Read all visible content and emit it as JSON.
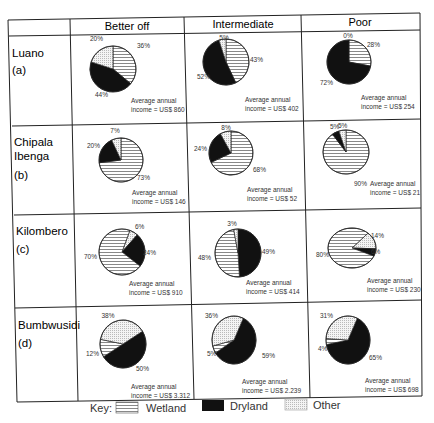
{
  "columns": [
    "Better off",
    "Intermediate",
    "Poor"
  ],
  "rows": [
    {
      "site": "Luano",
      "label": "(a)"
    },
    {
      "site": "Chipala Ibenga",
      "site_lines": [
        "Chipala",
        "Ibenga"
      ],
      "label": "(b)"
    },
    {
      "site": "Kilombero",
      "label": "(c)"
    },
    {
      "site": "Bumbwusidi",
      "label": "(d)"
    }
  ],
  "key": {
    "title": "Key:",
    "items": [
      {
        "name": "Wetland",
        "pattern": "hatch"
      },
      {
        "name": "Dryland",
        "pattern": "solid",
        "color": "#111111"
      },
      {
        "name": "Other",
        "pattern": "dots"
      }
    ]
  },
  "income_prefix": "Average annual",
  "chart_data": {
    "type": "pie",
    "legend": [
      "Wetland",
      "Dryland",
      "Other"
    ],
    "legend_position": "bottom",
    "pies": [
      {
        "site": "Luano (a)",
        "group": "Better off",
        "wetland": 36,
        "dryland": 44,
        "other": 20,
        "income": "income = US$ 860"
      },
      {
        "site": "Luano (a)",
        "group": "Intermediate",
        "wetland": 43,
        "dryland": 52,
        "other": 5,
        "income": "income = US$ 402"
      },
      {
        "site": "Luano (a)",
        "group": "Poor",
        "wetland": 28,
        "dryland": 72,
        "other": 0,
        "income": "income = US$ 254"
      },
      {
        "site": "Chipala Ibenga (b)",
        "group": "Better off",
        "wetland": 73,
        "dryland": 20,
        "other": 7,
        "income": "income = US$ 146"
      },
      {
        "site": "Chipala Ibenga (b)",
        "group": "Intermediate",
        "wetland": 68,
        "dryland": 24,
        "other": 8,
        "income": "income = US$ 52"
      },
      {
        "site": "Chipala Ibenga (b)",
        "group": "Poor",
        "wetland": 90,
        "dryland": 5,
        "other": 5,
        "income": "income = US$ 21"
      },
      {
        "site": "Kilombero (c)",
        "group": "Better off",
        "wetland": 70,
        "dryland": 24,
        "other": 6,
        "income": "income = US$ 910"
      },
      {
        "site": "Kilombero (c)",
        "group": "Intermediate",
        "wetland": 48,
        "dryland": 49,
        "other": 3,
        "income": "income = US$ 414"
      },
      {
        "site": "Kilombero (c)",
        "group": "Poor",
        "wetland": 80,
        "dryland": 6,
        "other": 14,
        "income": "income = US$ 230"
      },
      {
        "site": "Bumbwusidi (d)",
        "group": "Better off",
        "wetland": 12,
        "dryland": 50,
        "other": 38,
        "income": "income = US$ 3.312"
      },
      {
        "site": "Bumbwusidi (d)",
        "group": "Intermediate",
        "wetland": 5,
        "dryland": 59,
        "other": 36,
        "income": "income = US$ 2.239"
      },
      {
        "site": "Bumbwusidi (d)",
        "group": "Poor",
        "wetland": 4,
        "dryland": 65,
        "other": 31,
        "income": "income = US$ 698"
      }
    ]
  },
  "render": {
    "pies": [
      {
        "cx": 113,
        "cy": 69,
        "rx": 23,
        "ry": 23,
        "start": 0,
        "order": [
          "wetland",
          "dryland",
          "other"
        ],
        "labels": [
          {
            "k": "other",
            "x": 90,
            "y": 41,
            "a": "start"
          },
          {
            "k": "wetland",
            "x": 137,
            "y": 48,
            "a": "start"
          },
          {
            "k": "dryland",
            "x": 95,
            "y": 97,
            "a": "start"
          }
        ],
        "inc": {
          "x": 131,
          "y": 103
        }
      },
      {
        "cx": 226,
        "cy": 62,
        "rx": 23,
        "ry": 23,
        "start": 0,
        "order": [
          "wetland",
          "dryland",
          "other"
        ],
        "labels": [
          {
            "k": "other",
            "x": 224,
            "y": 40,
            "a": "middle"
          },
          {
            "k": "wetland",
            "x": 250,
            "y": 62,
            "a": "start"
          },
          {
            "k": "dryland",
            "x": 197,
            "y": 79,
            "a": "start"
          }
        ],
        "inc": {
          "x": 245,
          "y": 102
        }
      },
      {
        "cx": 349,
        "cy": 62,
        "rx": 22,
        "ry": 22,
        "start": 0,
        "order": [
          "wetland",
          "dryland",
          "other"
        ],
        "labels": [
          {
            "k": "other",
            "x": 348,
            "y": 38,
            "a": "middle"
          },
          {
            "k": "wetland",
            "x": 367,
            "y": 47,
            "a": "start"
          },
          {
            "k": "dryland",
            "x": 320,
            "y": 85,
            "a": "start"
          }
        ],
        "inc": {
          "x": 361,
          "y": 100
        }
      },
      {
        "cx": 121,
        "cy": 160,
        "rx": 22,
        "ry": 22,
        "start": 0,
        "order": [
          "wetland",
          "dryland",
          "other"
        ],
        "labels": [
          {
            "k": "other",
            "x": 115,
            "y": 133,
            "a": "middle"
          },
          {
            "k": "dryland",
            "x": 87,
            "y": 148,
            "a": "start"
          },
          {
            "k": "wetland",
            "x": 137,
            "y": 180,
            "a": "start"
          }
        ],
        "inc": {
          "x": 132,
          "y": 195
        }
      },
      {
        "cx": 231,
        "cy": 153,
        "rx": 22,
        "ry": 22,
        "start": 0,
        "order": [
          "wetland",
          "dryland",
          "other"
        ],
        "labels": [
          {
            "k": "other",
            "x": 226,
            "y": 130,
            "a": "middle"
          },
          {
            "k": "dryland",
            "x": 194,
            "y": 151,
            "a": "start"
          },
          {
            "k": "wetland",
            "x": 253,
            "y": 172,
            "a": "start"
          }
        ],
        "inc": {
          "x": 247,
          "y": 192
        }
      },
      {
        "cx": 346,
        "cy": 152,
        "rx": 23,
        "ry": 22,
        "start": 0,
        "order": [
          "wetland",
          "dryland",
          "other"
        ],
        "labels": [
          {
            "k": "dryland",
            "x": 330,
            "y": 129,
            "a": "start"
          },
          {
            "k": "other",
            "x": 338,
            "y": 128,
            "a": "start"
          },
          {
            "k": "wetland",
            "x": 354,
            "y": 186,
            "a": "start"
          }
        ],
        "inc": {
          "x": 370,
          "y": 186
        }
      },
      {
        "cx": 122,
        "cy": 252,
        "rx": 23,
        "ry": 23,
        "start": 20,
        "order": [
          "other",
          "dryland",
          "wetland"
        ],
        "labels": [
          {
            "k": "other",
            "x": 135,
            "y": 229,
            "a": "start"
          },
          {
            "k": "dryland",
            "x": 143,
            "y": 255,
            "a": "start"
          },
          {
            "k": "wetland",
            "x": 84,
            "y": 259,
            "a": "start"
          }
        ],
        "inc": {
          "x": 129,
          "y": 286
        }
      },
      {
        "cx": 238,
        "cy": 253,
        "rx": 23,
        "ry": 24,
        "start": 0,
        "order": [
          "dryland",
          "wetland",
          "other"
        ],
        "labels": [
          {
            "k": "other",
            "x": 232,
            "y": 226,
            "a": "middle"
          },
          {
            "k": "dryland",
            "x": 262,
            "y": 254,
            "a": "start"
          },
          {
            "k": "wetland",
            "x": 198,
            "y": 260,
            "a": "start"
          }
        ],
        "inc": {
          "x": 246,
          "y": 285
        }
      },
      {
        "cx": 352,
        "cy": 248,
        "rx": 24,
        "ry": 20,
        "start": 42,
        "order": [
          "other",
          "dryland",
          "wetland"
        ],
        "labels": [
          {
            "k": "other",
            "x": 371,
            "y": 238,
            "a": "start"
          },
          {
            "k": "dryland",
            "x": 371,
            "y": 254,
            "a": "start"
          },
          {
            "k": "wetland",
            "x": 316,
            "y": 257,
            "a": "start"
          }
        ],
        "inc": {
          "x": 367,
          "y": 283
        }
      },
      {
        "cx": 123,
        "cy": 344,
        "rx": 23,
        "ry": 24,
        "start": 58,
        "order": [
          "dryland",
          "wetland",
          "other"
        ],
        "labels": [
          {
            "k": "other",
            "x": 108,
            "y": 318,
            "a": "middle"
          },
          {
            "k": "wetland",
            "x": 86,
            "y": 356,
            "a": "start"
          },
          {
            "k": "dryland",
            "x": 136,
            "y": 371,
            "a": "start"
          }
        ],
        "inc": {
          "x": 131,
          "y": 389
        }
      },
      {
        "cx": 234,
        "cy": 340,
        "rx": 22,
        "ry": 24,
        "start": 25,
        "order": [
          "dryland",
          "wetland",
          "other"
        ],
        "labels": [
          {
            "k": "other",
            "x": 205,
            "y": 318,
            "a": "start"
          },
          {
            "k": "wetland",
            "x": 207,
            "y": 356,
            "a": "start"
          },
          {
            "k": "dryland",
            "x": 262,
            "y": 358,
            "a": "start"
          }
        ],
        "inc": {
          "x": 242,
          "y": 384
        }
      },
      {
        "cx": 348,
        "cy": 340,
        "rx": 22,
        "ry": 24,
        "start": 25,
        "order": [
          "dryland",
          "wetland",
          "other"
        ],
        "labels": [
          {
            "k": "other",
            "x": 320,
            "y": 318,
            "a": "start"
          },
          {
            "k": "wetland",
            "x": 318,
            "y": 351,
            "a": "start"
          },
          {
            "k": "dryland",
            "x": 369,
            "y": 360,
            "a": "start"
          }
        ],
        "inc": {
          "x": 365,
          "y": 383
        }
      }
    ]
  }
}
